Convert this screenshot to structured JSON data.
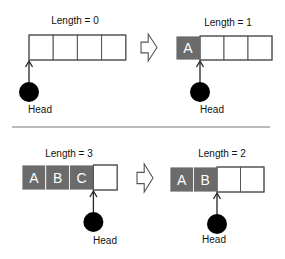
{
  "colors": {
    "filled_cell": "#6b6b6b",
    "empty_cell": "#ffffff",
    "cell_border": "#555555",
    "head": "#000000",
    "divider": "#777777",
    "arrow_outline": "#555555"
  },
  "panels": [
    {
      "id": "push-before",
      "length_label": "Length = 0",
      "capacity": 4,
      "cells": [
        "",
        "",
        "",
        ""
      ],
      "head_index": 0,
      "head_label": "Head"
    },
    {
      "id": "push-after",
      "length_label": "Length = 1",
      "capacity": 4,
      "cells": [
        "A",
        "",
        "",
        ""
      ],
      "head_index": 1,
      "head_label": "Head"
    },
    {
      "id": "pop-before",
      "length_label": "Length = 3",
      "capacity": 4,
      "cells": [
        "A",
        "B",
        "C",
        ""
      ],
      "head_index": 3,
      "head_label": "Head"
    },
    {
      "id": "pop-after",
      "length_label": "Length = 2",
      "capacity": 4,
      "cells": [
        "A",
        "B",
        "",
        ""
      ],
      "head_index": 2,
      "head_label": "Head"
    }
  ],
  "transitions": [
    {
      "from": "push-before",
      "to": "push-after",
      "icon": "block-arrow-right-icon"
    },
    {
      "from": "pop-before",
      "to": "pop-after",
      "icon": "block-arrow-right-icon"
    }
  ]
}
